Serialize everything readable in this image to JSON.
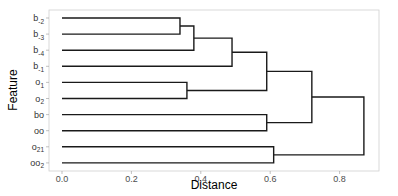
{
  "chart_data": {
    "type": "dendrogram",
    "title": "",
    "xlabel": "Distance",
    "ylabel": "Feature",
    "xlim": [
      -0.04,
      0.91
    ],
    "xticks": [
      0.0,
      0.2,
      0.4,
      0.6,
      0.8
    ],
    "xtick_labels": [
      "0.0",
      "0.2",
      "0.4",
      "0.6",
      "0.8"
    ],
    "grid": false,
    "leaves": [
      {
        "id": "b-2",
        "base": "b",
        "sub": "-2"
      },
      {
        "id": "b-3",
        "base": "b",
        "sub": "-3"
      },
      {
        "id": "b-4",
        "base": "b",
        "sub": "-4"
      },
      {
        "id": "b-1",
        "base": "b",
        "sub": "-1"
      },
      {
        "id": "o1",
        "base": "o",
        "sub": "1"
      },
      {
        "id": "o2",
        "base": "o",
        "sub": "2"
      },
      {
        "id": "bo",
        "base": "bo",
        "sub": ""
      },
      {
        "id": "oo",
        "base": "oo",
        "sub": ""
      },
      {
        "id": "o21",
        "base": "o",
        "sub": "21"
      },
      {
        "id": "oo2",
        "base": "oo",
        "sub": "2"
      }
    ],
    "merges": [
      {
        "id": "m1",
        "children": [
          "b-2",
          "b-3"
        ],
        "height": 0.34
      },
      {
        "id": "m2",
        "children": [
          "m1",
          "b-4"
        ],
        "height": 0.38
      },
      {
        "id": "m3",
        "children": [
          "m2",
          "b-1"
        ],
        "height": 0.49
      },
      {
        "id": "m4",
        "children": [
          "o1",
          "o2"
        ],
        "height": 0.36
      },
      {
        "id": "m5",
        "children": [
          "m3",
          "m4"
        ],
        "height": 0.59
      },
      {
        "id": "m6",
        "children": [
          "bo",
          "oo"
        ],
        "height": 0.59
      },
      {
        "id": "m7",
        "children": [
          "m5",
          "m6"
        ],
        "height": 0.72
      },
      {
        "id": "m8",
        "children": [
          "o21",
          "oo2"
        ],
        "height": 0.61
      },
      {
        "id": "m9",
        "children": [
          "m7",
          "m8"
        ],
        "height": 0.87
      }
    ],
    "colors": {
      "line": "#1a1a1a",
      "frame": "#cccccc",
      "text": "#4d4d4d"
    }
  }
}
